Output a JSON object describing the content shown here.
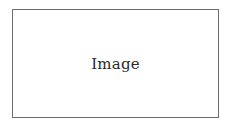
{
  "placeholder": {
    "label": "Image",
    "border_color": "#6b6b6b",
    "text_color": "#2a2a2a",
    "background": "#ffffff"
  }
}
